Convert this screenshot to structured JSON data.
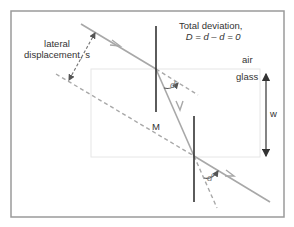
{
  "diagram": {
    "title_line1": "Total deviation,",
    "title_line2": "D = d – d = 0",
    "label_lateral_line1": "lateral",
    "label_lateral_line2": "displacement, s",
    "label_air": "air",
    "label_glass": "glass",
    "label_w": "w",
    "label_M": "M",
    "label_angle_top": "d",
    "label_angle_bottom": "d",
    "colors": {
      "frame": "#9a9a9a",
      "ray": "#a8a8a8",
      "normal": "#333333",
      "glass_edge": "#e6e6e6",
      "text": "#333333",
      "arrow": "#333333"
    }
  }
}
